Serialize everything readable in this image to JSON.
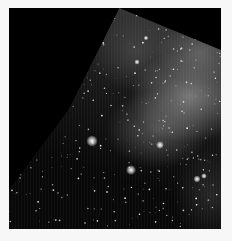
{
  "image": {
    "subject": "astronomical mosaic star field with nebulosity",
    "colors": {
      "background": "#f7f7f7",
      "sky": "#000000",
      "nebula": "#8c8c8c"
    },
    "bright_stars": [
      {
        "x": 83,
        "y": 133,
        "r": 3.2
      },
      {
        "x": 122,
        "y": 162,
        "r": 2.8
      },
      {
        "x": 151,
        "y": 137,
        "r": 2.2
      },
      {
        "x": 188,
        "y": 171,
        "r": 2.0
      },
      {
        "x": 195,
        "y": 168,
        "r": 1.6
      },
      {
        "x": 128,
        "y": 54,
        "r": 1.5
      },
      {
        "x": 137,
        "y": 30,
        "r": 1.3
      }
    ]
  }
}
